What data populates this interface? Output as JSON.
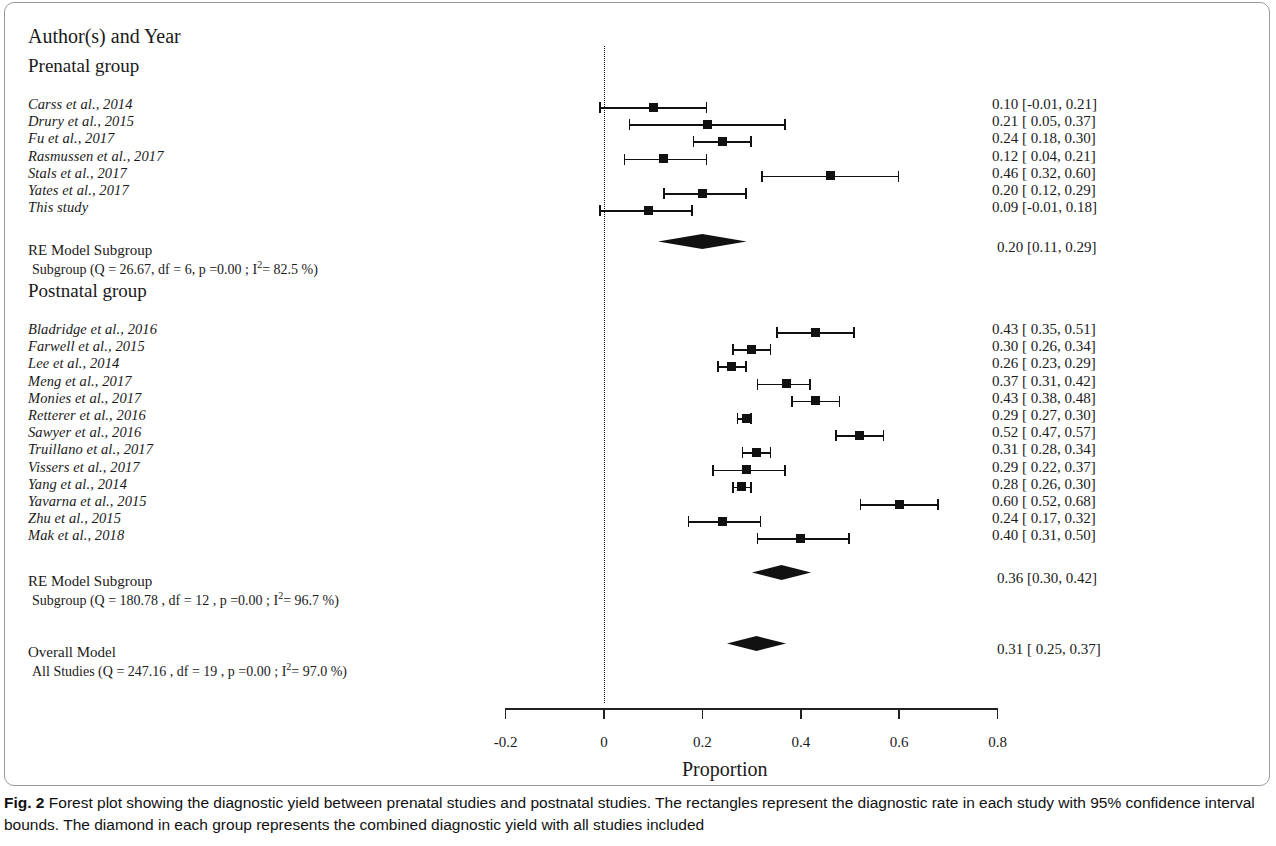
{
  "figure": {
    "column_header": "Author(s) and Year",
    "axis_title": "Proportion",
    "caption_prefix": "Fig. 2",
    "caption_text": " Forest plot showing the diagnostic yield between prenatal studies and postnatal studies. The rectangles represent the diagnostic rate in each study with 95% confidence interval bounds. The diamond in each group represents the combined diagnostic yield with all studies included"
  },
  "chart_data": {
    "type": "forest",
    "title": "",
    "xlabel": "Proportion",
    "ylabel": "",
    "xlim": [
      -0.25,
      0.82
    ],
    "xticks": [
      -0.2,
      0,
      0.2,
      0.4,
      0.6,
      0.8
    ],
    "xticklabels": [
      "-0.2",
      "0",
      "0.2",
      "0.4",
      "0.6",
      "0.8"
    ],
    "reference_line": 0,
    "grid": false,
    "groups": [
      {
        "name": "Prenatal group",
        "studies": [
          {
            "label": "Carss et al., 2014",
            "estimate": 0.1,
            "ci_low": -0.01,
            "ci_high": 0.21,
            "text": "0.10 [-0.01, 0.21]"
          },
          {
            "label": "Drury et al., 2015",
            "estimate": 0.21,
            "ci_low": 0.05,
            "ci_high": 0.37,
            "text": "0.21 [ 0.05, 0.37]"
          },
          {
            "label": "Fu et al., 2017",
            "estimate": 0.24,
            "ci_low": 0.18,
            "ci_high": 0.3,
            "text": "0.24 [ 0.18, 0.30]"
          },
          {
            "label": "Rasmussen et al., 2017",
            "estimate": 0.12,
            "ci_low": 0.04,
            "ci_high": 0.21,
            "text": "0.12 [ 0.04, 0.21]"
          },
          {
            "label": "Stals et al., 2017",
            "estimate": 0.46,
            "ci_low": 0.32,
            "ci_high": 0.6,
            "text": "0.46 [ 0.32, 0.60]"
          },
          {
            "label": "Yates et al., 2017",
            "estimate": 0.2,
            "ci_low": 0.12,
            "ci_high": 0.29,
            "text": "0.20 [ 0.12, 0.29]"
          },
          {
            "label": "This study",
            "estimate": 0.09,
            "ci_low": -0.01,
            "ci_high": 0.18,
            "text": "0.09 [-0.01, 0.18]"
          }
        ],
        "summary": {
          "title": "RE Model Subgroup",
          "stats_pre": "Subgroup (Q = 26.67, df = 6, p =0.00 ; I",
          "stats_sup": "2",
          "stats_post": "= 82.5 %)",
          "estimate": 0.2,
          "ci_low": 0.11,
          "ci_high": 0.29,
          "text": "0.20 [0.11, 0.29]"
        }
      },
      {
        "name": "Postnatal group",
        "studies": [
          {
            "label": "Bladridge et al., 2016",
            "estimate": 0.43,
            "ci_low": 0.35,
            "ci_high": 0.51,
            "text": "0.43 [ 0.35, 0.51]"
          },
          {
            "label": "Farwell et al., 2015",
            "estimate": 0.3,
            "ci_low": 0.26,
            "ci_high": 0.34,
            "text": "0.30 [ 0.26, 0.34]"
          },
          {
            "label": "Lee et al., 2014",
            "estimate": 0.26,
            "ci_low": 0.23,
            "ci_high": 0.29,
            "text": "0.26 [ 0.23, 0.29]"
          },
          {
            "label": "Meng et al., 2017",
            "estimate": 0.37,
            "ci_low": 0.31,
            "ci_high": 0.42,
            "text": "0.37 [ 0.31, 0.42]"
          },
          {
            "label": "Monies et al., 2017",
            "estimate": 0.43,
            "ci_low": 0.38,
            "ci_high": 0.48,
            "text": "0.43 [ 0.38, 0.48]"
          },
          {
            "label": "Retterer et al., 2016",
            "estimate": 0.29,
            "ci_low": 0.27,
            "ci_high": 0.3,
            "text": "0.29 [ 0.27, 0.30]"
          },
          {
            "label": "Sawyer et al., 2016",
            "estimate": 0.52,
            "ci_low": 0.47,
            "ci_high": 0.57,
            "text": "0.52 [ 0.47, 0.57]"
          },
          {
            "label": "Truillano et al., 2017",
            "estimate": 0.31,
            "ci_low": 0.28,
            "ci_high": 0.34,
            "text": "0.31 [ 0.28, 0.34]"
          },
          {
            "label": "Vissers et al., 2017",
            "estimate": 0.29,
            "ci_low": 0.22,
            "ci_high": 0.37,
            "text": "0.29 [ 0.22, 0.37]"
          },
          {
            "label": "Yang et al., 2014",
            "estimate": 0.28,
            "ci_low": 0.26,
            "ci_high": 0.3,
            "text": "0.28 [ 0.26, 0.30]"
          },
          {
            "label": "Yavarna et al., 2015",
            "estimate": 0.6,
            "ci_low": 0.52,
            "ci_high": 0.68,
            "text": "0.60 [ 0.52, 0.68]"
          },
          {
            "label": "Zhu et al., 2015",
            "estimate": 0.24,
            "ci_low": 0.17,
            "ci_high": 0.32,
            "text": "0.24 [ 0.17, 0.32]"
          },
          {
            "label": "Mak et al., 2018",
            "estimate": 0.4,
            "ci_low": 0.31,
            "ci_high": 0.5,
            "text": "0.40 [ 0.31, 0.50]"
          }
        ],
        "summary": {
          "title": "RE Model Subgroup",
          "stats_pre": "Subgroup (Q = 180.78 , df = 12 , p =0.00 ; I",
          "stats_sup": "2",
          "stats_post": "= 96.7 %)",
          "estimate": 0.36,
          "ci_low": 0.3,
          "ci_high": 0.42,
          "text": "0.36 [0.30, 0.42]"
        }
      }
    ],
    "overall": {
      "title": "Overall Model",
      "stats_pre": "All Studies (Q = 247.16 , df =  19 , p =0.00 ; I",
      "stats_sup": "2",
      "stats_post": "= 97.0 %)",
      "estimate": 0.31,
      "ci_low": 0.25,
      "ci_high": 0.37,
      "text": "0.31 [ 0.25, 0.37]"
    }
  },
  "colors": {
    "marker": "#111111",
    "axis": "#222222",
    "text": "#1a1a1a",
    "border": "#9a9a9a"
  }
}
